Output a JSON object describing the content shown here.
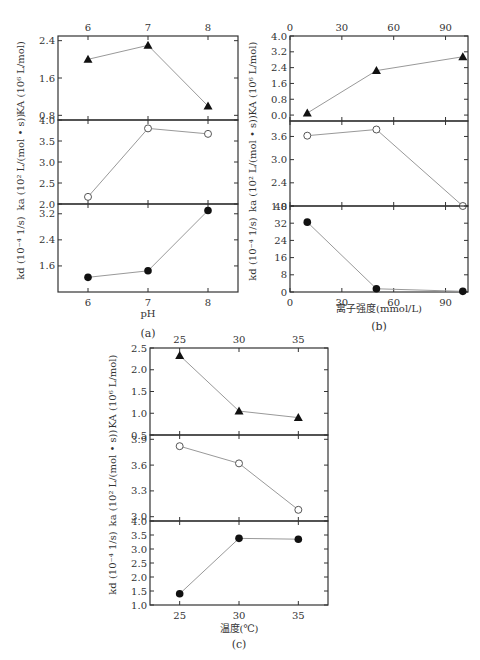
{
  "chart_data": [
    {
      "id": "a",
      "type": "line",
      "caption": "(a)",
      "xlabel": "pH",
      "x": [
        6,
        7,
        8
      ],
      "xticks": [
        6,
        7,
        8
      ],
      "xlim": [
        5.5,
        8.5
      ],
      "panels": [
        {
          "ylabel": "K_A (10^6 L/mol)",
          "ylabel_text": "KA (10⁶ L/mol)",
          "marker": "filled-triangle",
          "yticks": [
            0.8,
            1.6,
            2.4
          ],
          "ylim": [
            0.7,
            2.5
          ],
          "values": [
            2.0,
            2.3,
            1.0
          ]
        },
        {
          "ylabel": "k_a (10^2 L/(mol·s))",
          "ylabel_text": "ka (10² L/(mol • s))",
          "marker": "open-circle",
          "yticks": [
            2.0,
            2.5,
            3.0,
            3.5,
            4.0
          ],
          "ylim": [
            2.0,
            4.0
          ],
          "values": [
            2.17,
            3.8,
            3.67
          ]
        },
        {
          "ylabel": "k_d (10^-4 1/s)",
          "ylabel_text": "kd (10⁻⁴ 1/s)",
          "marker": "filled-circle",
          "yticks": [
            1.6,
            2.4,
            3.2
          ],
          "ylim": [
            0.8,
            3.5
          ],
          "values": [
            1.25,
            1.45,
            3.3
          ]
        }
      ]
    },
    {
      "id": "b",
      "type": "line",
      "caption": "(b)",
      "xlabel": "离子强度(mmol/L)",
      "x": [
        10,
        50,
        100
      ],
      "xticks": [
        0,
        30,
        60,
        90
      ],
      "xlim": [
        0,
        103
      ],
      "panels": [
        {
          "ylabel": "K_A (10^6 L/mol)",
          "ylabel_text": "KA (10⁶ L/mol)",
          "marker": "filled-triangle",
          "yticks": [
            0.0,
            0.8,
            1.6,
            2.4,
            3.2,
            4.0
          ],
          "ylim": [
            -0.3,
            4.0
          ],
          "values": [
            0.1,
            2.25,
            2.95
          ]
        },
        {
          "ylabel": "k_a (10^2 L/(mol·s))",
          "ylabel_text": "ka (10² L/(mol • s))",
          "marker": "open-circle",
          "yticks": [
            1.8,
            2.4,
            3.0,
            3.6
          ],
          "ylim": [
            1.8,
            4.0
          ],
          "values": [
            3.62,
            3.78,
            1.8
          ]
        },
        {
          "ylabel": "k_d (10^-4 1/s)",
          "ylabel_text": "kd (10⁻⁴ 1/s)",
          "marker": "filled-circle",
          "yticks": [
            0,
            8,
            16,
            24,
            32,
            40
          ],
          "ylim": [
            0,
            40
          ],
          "values": [
            32.5,
            1.5,
            0.3
          ]
        }
      ]
    },
    {
      "id": "c",
      "type": "line",
      "caption": "(c)",
      "xlabel": "温度(℃)",
      "x": [
        25,
        30,
        35
      ],
      "xticks": [
        25,
        30,
        35
      ],
      "xlim": [
        22.5,
        37.5
      ],
      "panels": [
        {
          "ylabel": "K_A (10^6 L/mol)",
          "ylabel_text": "KA (10⁶ L/mol)",
          "marker": "filled-triangle",
          "yticks": [
            0.5,
            1.0,
            1.5,
            2.0,
            2.5
          ],
          "ylim": [
            0.5,
            2.5
          ],
          "values": [
            2.33,
            1.05,
            0.9
          ]
        },
        {
          "ylabel": "k_a (10^2 L/(mol·s))",
          "ylabel_text": "ka (10² L/(mol • s))",
          "marker": "open-circle",
          "yticks": [
            3.0,
            3.3,
            3.6,
            3.9
          ],
          "ylim": [
            2.95,
            3.95
          ],
          "values": [
            3.82,
            3.62,
            3.08
          ]
        },
        {
          "ylabel": "k_d (10^-4 1/s)",
          "ylabel_text": "kd (10⁻⁴ 1/s)",
          "marker": "filled-circle",
          "yticks": [
            1.0,
            1.5,
            2.0,
            2.5,
            3.0,
            3.5,
            4.0
          ],
          "ylim": [
            1.0,
            4.0
          ],
          "values": [
            1.4,
            3.38,
            3.35
          ]
        }
      ]
    }
  ],
  "layout": {
    "a": {
      "left": 58,
      "right": 238,
      "tops": [
        36,
        120,
        204
      ],
      "bottom": 292,
      "xlabel_y": 322,
      "caption_y": 337
    },
    "b": {
      "left": 290,
      "right": 468,
      "tops": [
        36,
        121,
        206
      ],
      "bottom": 292,
      "xlabel_y": 312,
      "caption_y": 330
    },
    "c": {
      "left": 150,
      "right": 328,
      "tops": [
        348,
        435,
        521
      ],
      "bottom": 605,
      "xlabel_y": 632,
      "caption_y": 648
    }
  },
  "colors": {
    "axis": "#333333",
    "line": "#999999",
    "marker": "#111111"
  }
}
